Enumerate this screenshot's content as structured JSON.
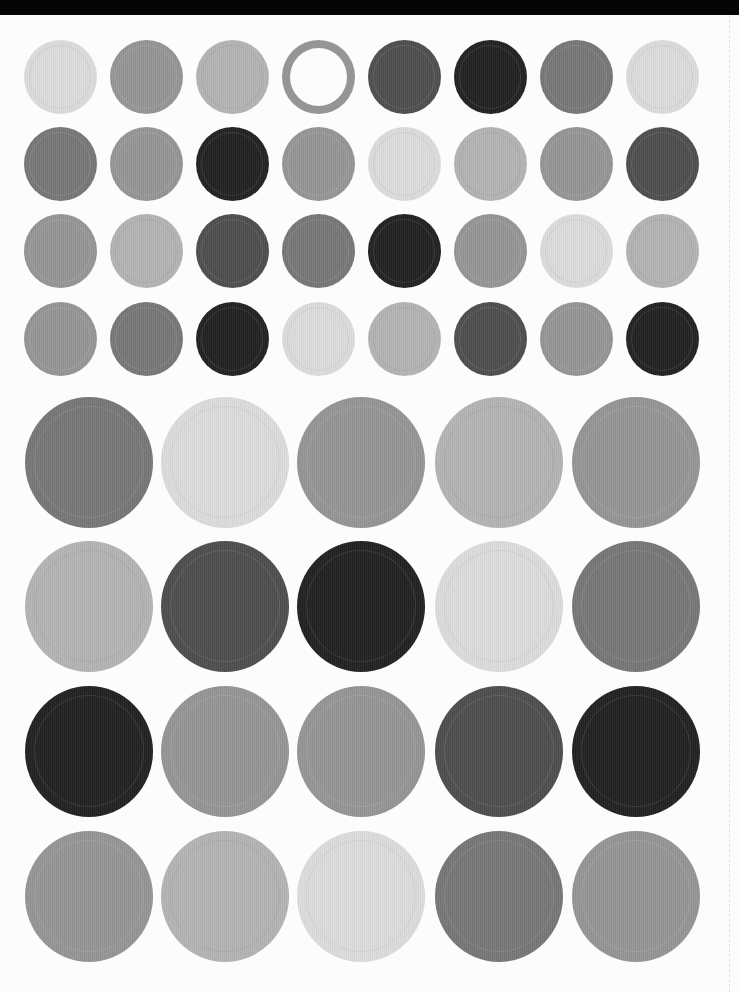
{
  "sheet": {
    "description": "Sheet of round sticker labels in grayscale shades",
    "top_band_color": "#050505",
    "background_color": "#fcfcfc"
  },
  "shades": {
    "L": "#dcdcdc",
    "ML": "#b4b4b4",
    "M": "#959595",
    "MD": "#777777",
    "D": "#4e4e4e",
    "K": "#222222"
  },
  "small_grid": {
    "diameter_x": 73,
    "diameter_y": 74,
    "column_centers": [
      60,
      146,
      232,
      318,
      404,
      490,
      576,
      662
    ],
    "row_centers": [
      77,
      164,
      251,
      339
    ],
    "rows": [
      [
        "L",
        "M",
        "ML",
        "RING:M",
        "D",
        "K",
        "MD",
        "L"
      ],
      [
        "MD",
        "M",
        "K",
        "M",
        "L",
        "ML",
        "M",
        "D"
      ],
      [
        "M",
        "ML",
        "D",
        "MD",
        "K",
        "M",
        "L",
        "ML"
      ],
      [
        "M",
        "MD",
        "K",
        "L",
        "ML",
        "D",
        "M",
        "K"
      ]
    ]
  },
  "large_grid": {
    "diameter_x": 128,
    "diameter_y": 131,
    "column_centers": [
      89,
      225,
      361,
      499,
      636
    ],
    "row_centers": [
      462,
      606,
      751,
      896
    ],
    "rows": [
      [
        "MD",
        "L",
        "M",
        "ML",
        "M"
      ],
      [
        "ML",
        "D",
        "K",
        "L",
        "MD"
      ],
      [
        "K",
        "M",
        "M",
        "D",
        "K"
      ],
      [
        "M",
        "ML",
        "L",
        "MD",
        "M"
      ]
    ]
  }
}
